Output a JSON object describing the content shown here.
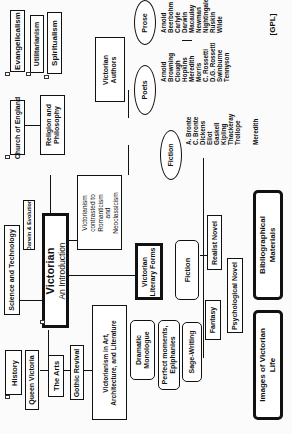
{
  "diagram": {
    "orientation": "rotated-90-ccw",
    "root": {
      "title": "Victorian",
      "subtitle": "An Introduction"
    },
    "nodes": {
      "religion": "Religion and|Philosophy",
      "church": "Church of England",
      "evangelicalism": "Evangelicalism",
      "utilitarianism": "Utilitarianism",
      "spiritualism": "Spiritualism",
      "science": "Science and Technology",
      "darwin": "Darwin & Evolution",
      "contrast": "Victorianism|contrasted to|Romanticism|and|Neoclassicism",
      "history": "History",
      "queen": "Queen Victoria",
      "arts": "The Arts",
      "revival": "Gothic Revival",
      "victorianism_art": "Victorianism in Art,|Architecture, and Literature",
      "literary_forms": "Victorian|Literary Forms",
      "fiction": "Fiction",
      "realist": "Realist Novel",
      "fantasy": "Fantasy",
      "psychological": "Psychological Novel",
      "dramatic": "Dramatic|Monologue",
      "perfect": "Perfect moments,|Epiphanies",
      "sage": "Sage-Writing",
      "biblio": "Bibliographical|Materials",
      "images": "Images of Victorian|Life",
      "authors": "Victorian|Authors",
      "poets": "Poets",
      "prose": "Prose",
      "fiction_oval": "Fiction"
    },
    "poets_list": [
      "Arnold",
      "Browning",
      "Clough",
      "Hopkins",
      "Meredith",
      "Morris",
      "C. Rossetti",
      "D.G. Rossetti",
      "Swinburne",
      "Tennyson"
    ],
    "prose_list": [
      "Arnold",
      "Beerbohm",
      "Carlyle",
      "Darwin",
      "Macaulay",
      "Newman",
      "Nightingale",
      "Ruskin",
      "Wilde"
    ],
    "fiction_list": [
      "A. Bronte",
      "C. Bronte",
      "Dickens",
      "Eliot",
      "Gaskell",
      "Kipling",
      "Thackeray",
      "Trollope",
      "",
      "Meredith"
    ],
    "footer": "[GPL]"
  }
}
